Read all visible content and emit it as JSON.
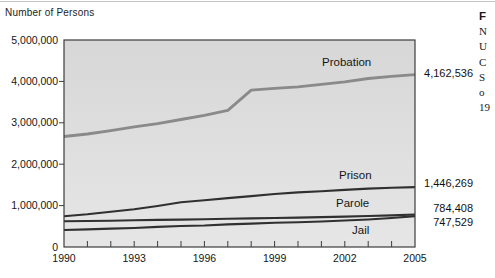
{
  "axis_title": "Number of Persons",
  "colors": {
    "plot_bg_top": "#d7d7d7",
    "plot_bg_bottom": "#e6e6e6",
    "frame": "#3c3c3c",
    "probation_line": "#8a8a8a",
    "dark_line": "#303030",
    "top_rule": "#c4c4c4"
  },
  "chart_data": {
    "type": "line",
    "title": "",
    "ylabel": "Number of Persons",
    "xlabel": "",
    "grid": false,
    "legend": "inline-labels",
    "xlim": [
      1990,
      2005
    ],
    "ylim": [
      0,
      5000000
    ],
    "x": [
      1990,
      1991,
      1992,
      1993,
      1994,
      1995,
      1996,
      1997,
      1998,
      1999,
      2000,
      2001,
      2002,
      2003,
      2004,
      2005
    ],
    "x_tick_labels": [
      "1990",
      "1993",
      "1996",
      "1999",
      "2002",
      "2005"
    ],
    "x_tick_years": [
      1990,
      1993,
      1996,
      1999,
      2002,
      2005
    ],
    "y_tick_labels": [
      "0",
      "1,000,000",
      "2,000,000",
      "3,000,000",
      "4,000,000",
      "5,000,000"
    ],
    "y_tick_values": [
      0,
      1000000,
      2000000,
      3000000,
      4000000,
      5000000
    ],
    "series": [
      {
        "name": "Probation",
        "end_label": "4,162,536",
        "color": "#8a8a8a",
        "width": 2.8,
        "values": [
          2670000,
          2730000,
          2810000,
          2900000,
          2980000,
          3080000,
          3180000,
          3300000,
          3790000,
          3830000,
          3870000,
          3930000,
          3990000,
          4070000,
          4120000,
          4162536
        ]
      },
      {
        "name": "Prison",
        "end_label": "1,446,269",
        "color": "#303030",
        "width": 2.1,
        "values": [
          743000,
          790000,
          850000,
          910000,
          990000,
          1080000,
          1130000,
          1180000,
          1230000,
          1280000,
          1320000,
          1345000,
          1380000,
          1410000,
          1430000,
          1446269
        ]
      },
      {
        "name": "Parole",
        "end_label": "784,408",
        "color": "#303030",
        "width": 2.1,
        "values": [
          620000,
          628000,
          636000,
          645000,
          654000,
          663000,
          672000,
          681000,
          690000,
          700000,
          710000,
          722000,
          734000,
          748000,
          764000,
          784408
        ]
      },
      {
        "name": "Jail",
        "end_label": "747,529",
        "color": "#303030",
        "width": 2.1,
        "values": [
          410000,
          426000,
          444000,
          459000,
          486000,
          507000,
          520000,
          545000,
          565000,
          585000,
          600000,
          615000,
          640000,
          665000,
          700000,
          747529
        ]
      }
    ]
  },
  "caption_fragment": {
    "lines": [
      "F",
      "N",
      "U",
      "C",
      "S",
      "o",
      "19"
    ]
  }
}
